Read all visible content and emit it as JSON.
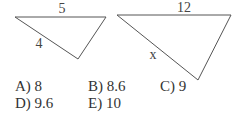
{
  "figure": {
    "triangle1": {
      "top_side": "5",
      "left_side": "4"
    },
    "triangle2": {
      "top_side": "12",
      "left_side": "x"
    }
  },
  "options": [
    {
      "label": "A) 8"
    },
    {
      "label": "B) 8.6"
    },
    {
      "label": "C) 9"
    },
    {
      "label": "D) 9.6"
    },
    {
      "label": "E) 10"
    }
  ]
}
